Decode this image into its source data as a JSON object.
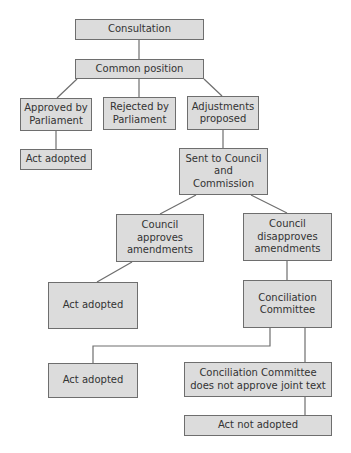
{
  "diagram": {
    "type": "flowchart",
    "nodes": {
      "consultation": "Consultation",
      "common_position": "Common position",
      "approved_by_parliament": "Approved by\nParliament",
      "rejected_by_parliament": "Rejected by\nParliament",
      "adjustments_proposed": "Adjustments\nproposed",
      "act_adopted_1": "Act adopted",
      "sent_to_council": "Sent to Council\nand\nCommission",
      "council_approves": "Council\napproves\namendments",
      "council_disapproves": "Council\ndisapproves\namendments",
      "act_adopted_2": "Act adopted",
      "conciliation_committee": "Conciliation\nCommittee",
      "act_adopted_3": "Act adopted",
      "cc_not_approve": "Conciliation Committee\ndoes not approve joint text",
      "act_not_adopted": "Act not adopted"
    },
    "edges": [
      [
        "consultation",
        "common_position"
      ],
      [
        "common_position",
        "approved_by_parliament"
      ],
      [
        "common_position",
        "rejected_by_parliament"
      ],
      [
        "common_position",
        "adjustments_proposed"
      ],
      [
        "approved_by_parliament",
        "act_adopted_1"
      ],
      [
        "adjustments_proposed",
        "sent_to_council"
      ],
      [
        "sent_to_council",
        "council_approves"
      ],
      [
        "sent_to_council",
        "council_disapproves"
      ],
      [
        "council_approves",
        "act_adopted_2"
      ],
      [
        "council_disapproves",
        "conciliation_committee"
      ],
      [
        "conciliation_committee",
        "act_adopted_3"
      ],
      [
        "conciliation_committee",
        "cc_not_approve"
      ],
      [
        "cc_not_approve",
        "act_not_adopted"
      ]
    ],
    "colors": {
      "node_fill": "#dcdcdc",
      "node_border": "#6e6e6e",
      "text": "#333333",
      "edge": "#6e6e6e"
    }
  }
}
